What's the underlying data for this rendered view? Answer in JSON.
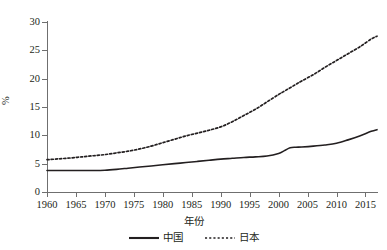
{
  "chart_data": {
    "type": "line",
    "title": "",
    "xlabel": "年份",
    "ylabel": "%",
    "xlim": [
      1960,
      2017
    ],
    "ylim": [
      0,
      30
    ],
    "ytick_labels": [
      "0",
      "5",
      "10",
      "15",
      "20",
      "25",
      "30"
    ],
    "ytick_values": [
      0,
      5,
      10,
      15,
      20,
      25,
      30
    ],
    "xtick_labels": [
      "1960",
      "1965",
      "1970",
      "1975",
      "1980",
      "1985",
      "1990",
      "1995",
      "2000",
      "2005",
      "2010",
      "2015"
    ],
    "xtick_values": [
      1960,
      1965,
      1970,
      1975,
      1980,
      1985,
      1990,
      1995,
      2000,
      2005,
      2010,
      2015
    ],
    "grid": false,
    "legend_position": "bottom",
    "x": [
      1960,
      1962,
      1964,
      1966,
      1968,
      1970,
      1972,
      1974,
      1976,
      1978,
      1980,
      1982,
      1984,
      1986,
      1988,
      1990,
      1992,
      1994,
      1996,
      1998,
      2000,
      2001,
      2002,
      2003,
      2004,
      2006,
      2008,
      2010,
      2012,
      2014,
      2016,
      2017
    ],
    "series": [
      {
        "name": "中国",
        "style": "solid",
        "color": "#231f20",
        "values": [
          3.8,
          3.8,
          3.8,
          3.8,
          3.8,
          3.85,
          4.0,
          4.2,
          4.4,
          4.6,
          4.8,
          5.0,
          5.2,
          5.4,
          5.6,
          5.8,
          5.95,
          6.1,
          6.2,
          6.35,
          6.8,
          7.3,
          7.8,
          7.9,
          7.95,
          8.1,
          8.3,
          8.6,
          9.2,
          9.9,
          10.7,
          11.0
        ]
      },
      {
        "name": "日本",
        "style": "dotted",
        "color": "#231f20",
        "values": [
          5.7,
          5.85,
          6.0,
          6.2,
          6.4,
          6.6,
          6.9,
          7.2,
          7.6,
          8.1,
          8.7,
          9.3,
          9.9,
          10.4,
          10.9,
          11.5,
          12.4,
          13.5,
          14.6,
          15.9,
          17.2,
          17.8,
          18.4,
          19.0,
          19.6,
          20.7,
          22.0,
          23.2,
          24.4,
          25.6,
          27.0,
          27.5
        ]
      }
    ]
  },
  "legend": {
    "items": [
      {
        "label": "中国",
        "style": "solid"
      },
      {
        "label": "日本",
        "style": "dotted"
      }
    ]
  }
}
